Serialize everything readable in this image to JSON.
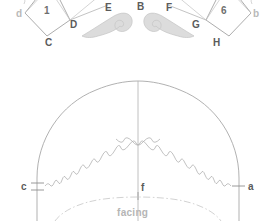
{
  "diagram": {
    "colors": {
      "line_primary": "#9a9a9a",
      "line_secondary": "#b0b0b0",
      "line_faint": "#c9c9c9",
      "scroll_fill": "#d9d9d9",
      "scroll_stroke": "#bdbdbd",
      "text_dark": "#5b5b5b",
      "text_mid": "#7d7d7d",
      "text_light": "#b9b9b9",
      "background": "#ffffff"
    }
  },
  "top_section": {
    "name": "brim-tab-construction",
    "left_polygon": {
      "number": "1",
      "vertices": [
        {
          "key": "d",
          "label": "d",
          "tone": "light"
        },
        {
          "key": "C",
          "label": "C",
          "tone": "dark"
        },
        {
          "key": "D",
          "label": "D",
          "tone": "dark"
        }
      ]
    },
    "right_polygon": {
      "number": "6",
      "vertices": [
        {
          "key": "G",
          "label": "G",
          "tone": "dark"
        },
        {
          "key": "H",
          "label": "H",
          "tone": "dark"
        },
        {
          "key": "b",
          "label": "b",
          "tone": "light"
        }
      ]
    },
    "free_labels": [
      {
        "key": "E",
        "label": "E",
        "tone": "dark"
      },
      {
        "key": "B",
        "label": "B",
        "tone": "dark"
      },
      {
        "key": "F",
        "label": "F",
        "tone": "dark"
      }
    ],
    "scrolls": [
      {
        "name": "left-scroll-motif",
        "orientation": "right-facing"
      },
      {
        "name": "right-scroll-motif",
        "orientation": "left-facing"
      }
    ]
  },
  "bottom_section": {
    "name": "crown-dome-pattern",
    "labels": [
      {
        "key": "c",
        "label": "c",
        "tone": "dark"
      },
      {
        "key": "f",
        "label": "f",
        "tone": "dark"
      },
      {
        "key": "a",
        "label": "a",
        "tone": "dark"
      },
      {
        "key": "facing",
        "label": "facing",
        "tone": "light"
      }
    ],
    "features": {
      "outer_edge": "dome outline",
      "inner_edge": "scalloped wire line",
      "center_line": "vertical center fold",
      "facing_line": "dash-dot facing seam arc",
      "notch_marks": "double tick at c and single tick at a"
    }
  }
}
